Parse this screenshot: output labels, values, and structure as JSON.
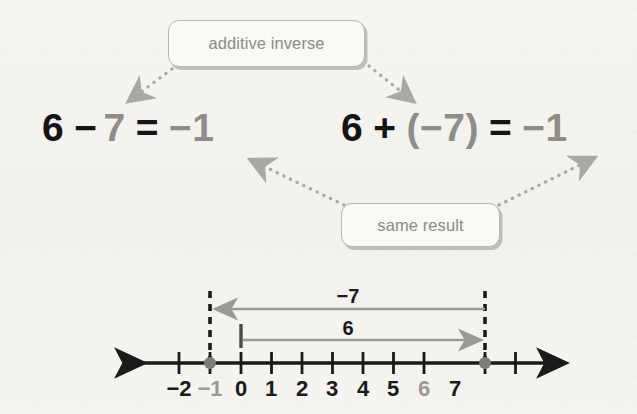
{
  "diagram": {
    "background_color": "#f4f3ef"
  },
  "callouts": [
    {
      "id": "additive-inverse",
      "label": "additive inverse",
      "text_color": "#8d8b86",
      "border_color": "#b9b7b2"
    },
    {
      "id": "same-result",
      "label": "same result",
      "text_color": "#8d8b86",
      "border_color": "#b9b7b2"
    }
  ],
  "equations": {
    "left": {
      "full": "6 − 7 = −1",
      "tokens": [
        {
          "text": "6",
          "color": "black"
        },
        {
          "text": "−",
          "color": "black"
        },
        {
          "text": "7",
          "color": "gray"
        },
        {
          "text": "=",
          "color": "black"
        },
        {
          "text": "−1",
          "color": "gray"
        }
      ]
    },
    "right": {
      "full": "6 + (−7) = −1",
      "tokens": [
        {
          "text": "6",
          "color": "black"
        },
        {
          "text": "+",
          "color": "black"
        },
        {
          "text": "(−7)",
          "color": "gray"
        },
        {
          "text": "=",
          "color": "black"
        },
        {
          "text": "−1",
          "color": "gray"
        }
      ]
    }
  },
  "number_line": {
    "min": -2,
    "max": 7,
    "tick_labels": [
      "−2",
      "−1",
      "0",
      "1",
      "2",
      "3",
      "4",
      "5",
      "6",
      "7"
    ],
    "highlighted_points": [
      -1,
      6
    ],
    "highlighted_label_color": "#9b9a95",
    "axis_color": "#1a1a1a",
    "jump_arrows": [
      {
        "label": "−7",
        "from": 6,
        "to": -1,
        "direction": "left",
        "color": "#9a9a95"
      },
      {
        "label": "6",
        "from": 0,
        "to": 6,
        "direction": "right",
        "color": "#9a9a95"
      }
    ],
    "dashed_guides": [
      -1,
      6
    ]
  },
  "connectors": [
    {
      "id": "inverse-to-left-term",
      "from": "additive-inverse",
      "to": "left-minus-seven",
      "style": "dotted",
      "color": "#a9a8a3"
    },
    {
      "id": "inverse-to-right-term",
      "from": "additive-inverse",
      "to": "right-minus-seven",
      "style": "dotted",
      "color": "#a9a8a3"
    },
    {
      "id": "result-to-left",
      "from": "same-result",
      "to": "left-result",
      "style": "dotted",
      "color": "#a9a8a3"
    },
    {
      "id": "result-to-right",
      "from": "same-result",
      "to": "right-result",
      "style": "dotted",
      "color": "#a9a8a3"
    }
  ]
}
